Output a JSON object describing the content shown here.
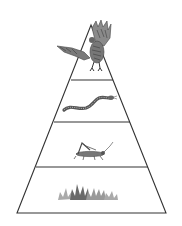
{
  "diagram": {
    "type": "food-pyramid",
    "title": "",
    "levels": [
      {
        "name": "hawk",
        "role": "tertiary consumer",
        "icon": "hawk-icon"
      },
      {
        "name": "snake",
        "role": "secondary consumer",
        "icon": "snake-icon"
      },
      {
        "name": "grasshopper",
        "role": "primary consumer",
        "icon": "grasshopper-icon"
      },
      {
        "name": "grass",
        "role": "producer",
        "icon": "grass-icon"
      }
    ],
    "colors": {
      "background": "#ffffff",
      "outline": "#333333",
      "animal_dark": "#555555",
      "animal_mid": "#888888",
      "grass_dark": "#6a6a6a",
      "grass_light": "#aaaaaa"
    }
  }
}
